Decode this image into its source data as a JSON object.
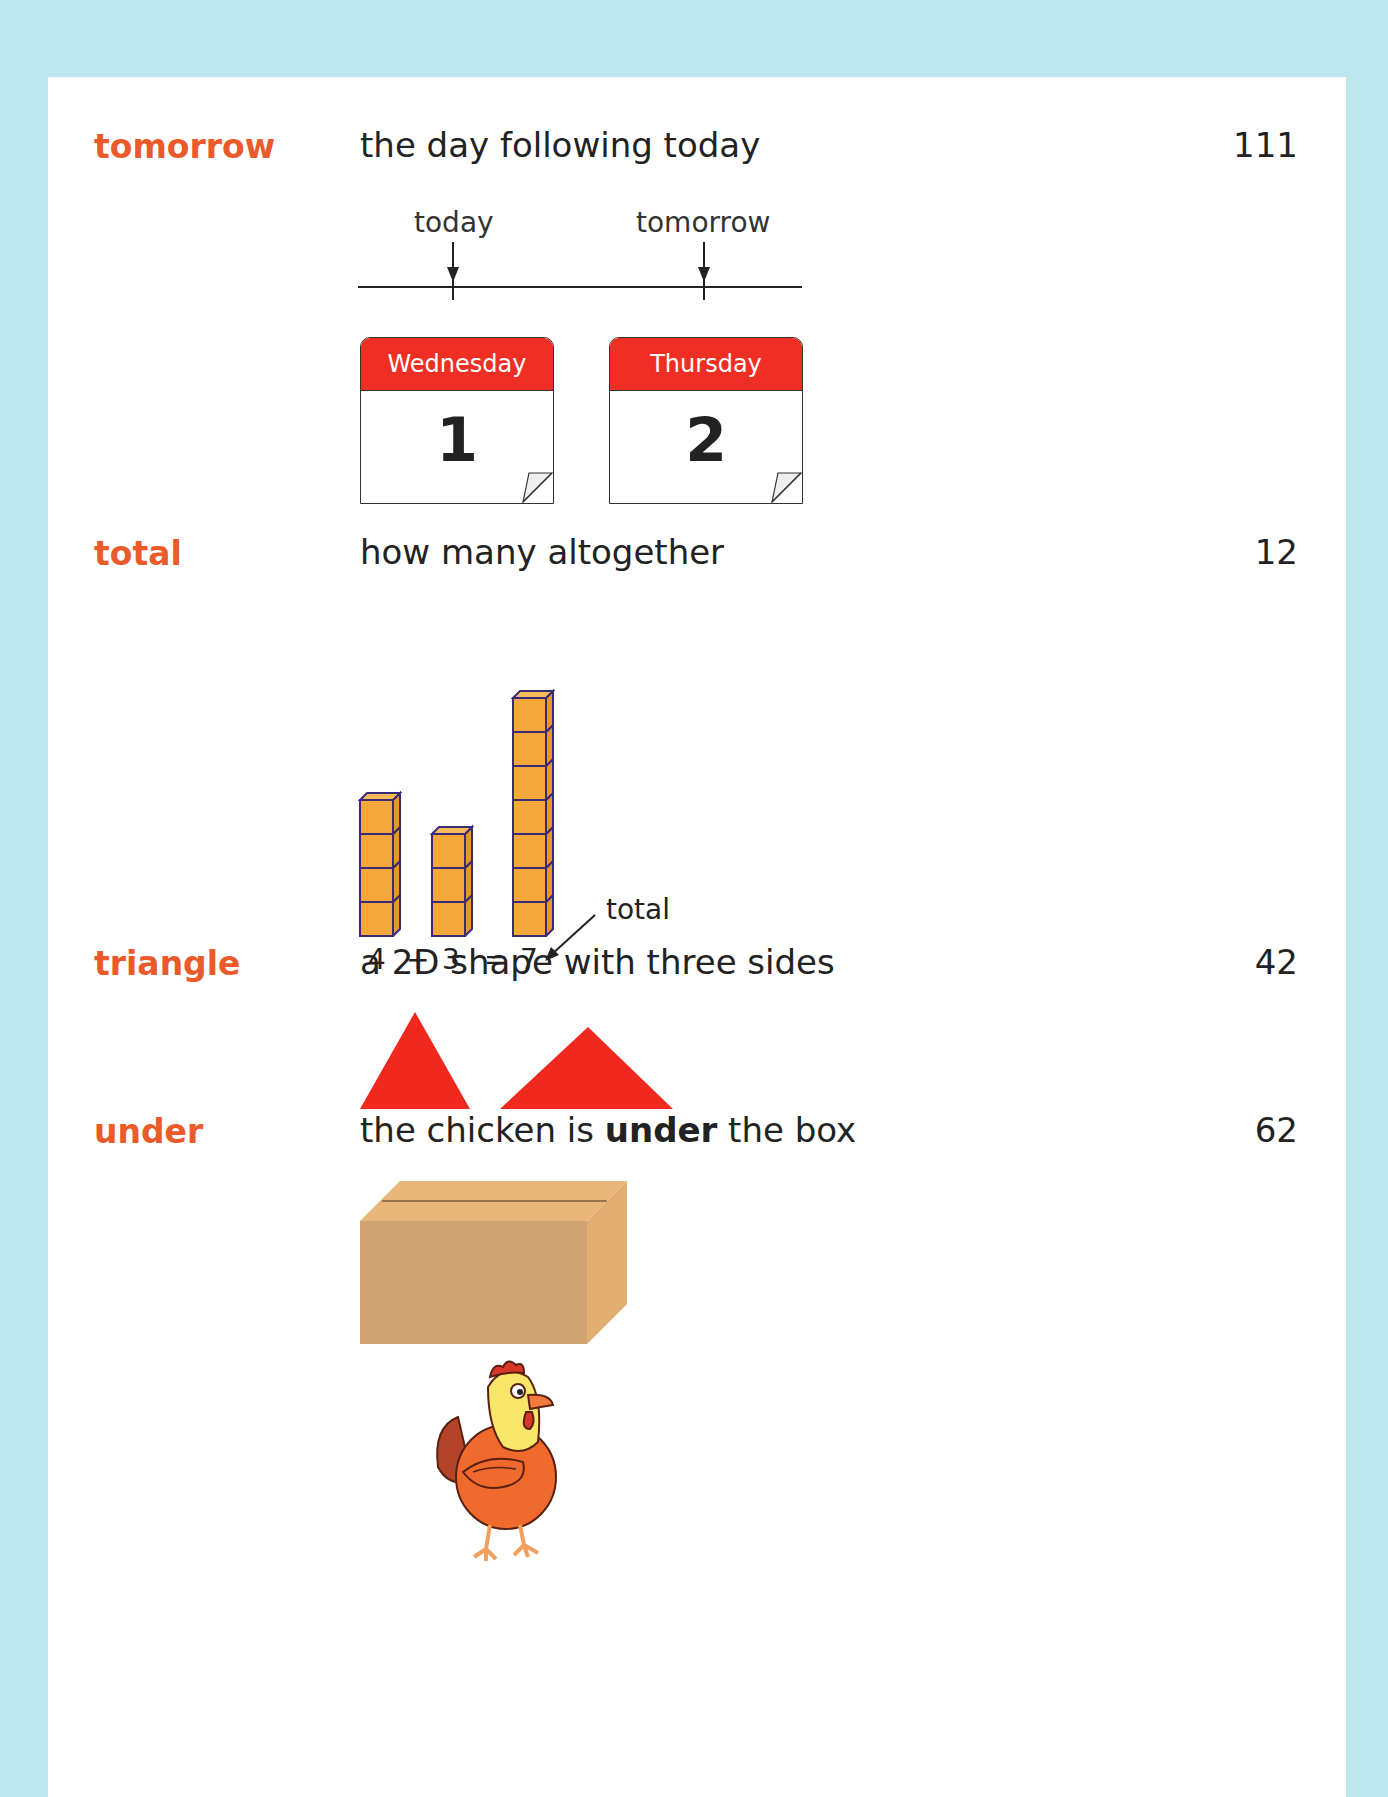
{
  "entries": [
    {
      "term": "tomorrow",
      "definition": "the day following today",
      "page": "111",
      "illustration": {
        "type": "timeline-calendars",
        "labels": [
          "today",
          "tomorrow"
        ],
        "calendars": [
          {
            "day": "Wednesday",
            "date": "1"
          },
          {
            "day": "Thursday",
            "date": "2"
          }
        ]
      }
    },
    {
      "term": "total",
      "definition": "how many altogether",
      "page": "12",
      "illustration": {
        "type": "cube-towers",
        "towers": [
          4,
          3,
          7
        ],
        "equation": {
          "a": "4",
          "plus": "+",
          "b": "3",
          "equals": "=",
          "result": "7"
        },
        "annotation": "total"
      }
    },
    {
      "term": "triangle",
      "definition": "a 2D shape with three sides",
      "page": "42",
      "illustration": {
        "type": "triangles",
        "count": 2
      }
    },
    {
      "term": "under",
      "definition_parts": [
        "the chicken is ",
        "under",
        " the box"
      ],
      "page": "62",
      "illustration": {
        "type": "box-above-chicken"
      }
    }
  ],
  "colors": {
    "term": "#ea5a2a",
    "calendar_header": "#ef2f24",
    "triangle": "#f0281e",
    "cube_fill": "#f5a83a",
    "cube_outline": "#3b2a7a",
    "box": "#cfa472",
    "background": "#bfe6ee"
  }
}
